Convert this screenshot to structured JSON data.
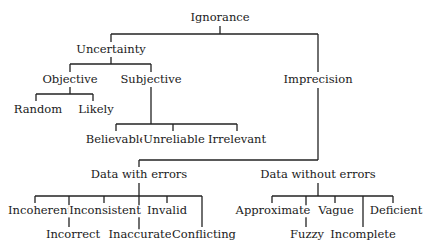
{
  "diagram": {
    "type": "tree",
    "root": "Ignorance",
    "nodes": {
      "ignorance": "Ignorance",
      "uncertainty": "Uncertainty",
      "imprecision": "Imprecision",
      "objective": "Objective",
      "subjective": "Subjective",
      "random": "Random",
      "likely": "Likely",
      "believable": "Believable",
      "unreliable": "Unreliable",
      "irrelevant": "Irrelevant",
      "data_with_errors": "Data with errors",
      "data_without_errors": "Data without errors",
      "incoherent": "Incoherent",
      "inconsistent": "Inconsistent",
      "invalid": "Invalid",
      "incorrect": "Incorrect",
      "inaccurate": "Inaccurate",
      "conflicting": "Conflicting",
      "approximate": "Approximate",
      "vague": "Vague",
      "deficient": "Deficient",
      "fuzzy": "Fuzzy",
      "incomplete": "Incomplete"
    },
    "edges": [
      [
        "Ignorance",
        "Uncertainty"
      ],
      [
        "Ignorance",
        "Imprecision"
      ],
      [
        "Uncertainty",
        "Objective"
      ],
      [
        "Uncertainty",
        "Subjective"
      ],
      [
        "Objective",
        "Random"
      ],
      [
        "Objective",
        "Likely"
      ],
      [
        "Subjective",
        "Believable"
      ],
      [
        "Subjective",
        "Unreliable"
      ],
      [
        "Subjective",
        "Irrelevant"
      ],
      [
        "Imprecision",
        "Data with errors"
      ],
      [
        "Imprecision",
        "Data without errors"
      ],
      [
        "Data with errors",
        "Incoherent"
      ],
      [
        "Data with errors",
        "Incorrect"
      ],
      [
        "Data with errors",
        "Inconsistent"
      ],
      [
        "Data with errors",
        "Inaccurate"
      ],
      [
        "Data with errors",
        "Invalid"
      ],
      [
        "Data with errors",
        "Conflicting"
      ],
      [
        "Data without errors",
        "Approximate"
      ],
      [
        "Data without errors",
        "Fuzzy"
      ],
      [
        "Data without errors",
        "Vague"
      ],
      [
        "Data without errors",
        "Incomplete"
      ],
      [
        "Data without errors",
        "Deficient"
      ]
    ]
  }
}
